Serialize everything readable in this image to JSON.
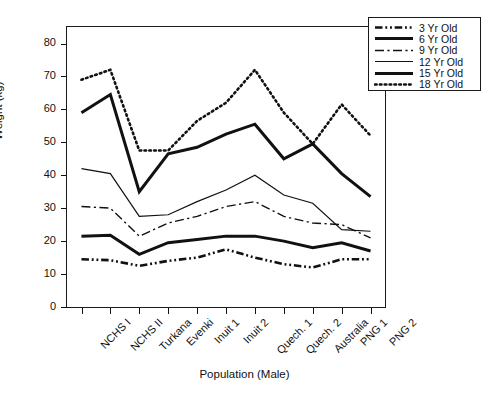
{
  "chart_data": {
    "type": "line",
    "title": "",
    "xlabel": "Population (Male)",
    "ylabel": "Weight (kg)",
    "categories": [
      "NCHS I",
      "NCHS II",
      "Turkana",
      "Evenki",
      "Inuit 1",
      "Inuit 2",
      "Quech. 1",
      "Quech. 2",
      "Australia",
      "PNG 1",
      "PNG 2"
    ],
    "ylim": [
      0,
      85
    ],
    "yticks": [
      0,
      10,
      20,
      30,
      40,
      50,
      60,
      70,
      80
    ],
    "grid": false,
    "legend_position": "top-right",
    "series": [
      {
        "name": "3 Yr Old",
        "style": "dash-dot-dot",
        "width": 2.6,
        "values": [
          14.5,
          14.2,
          12.5,
          14.0,
          15.0,
          17.5,
          15.0,
          13.0,
          12.0,
          14.5,
          14.5
        ]
      },
      {
        "name": "6 Yr Old",
        "style": "solid",
        "width": 2.9,
        "values": [
          21.5,
          21.8,
          16.0,
          19.5,
          20.5,
          21.5,
          21.5,
          20.0,
          18.0,
          19.5,
          17.0
        ]
      },
      {
        "name": "9 Yr Old",
        "style": "dash-dot",
        "width": 1.4,
        "values": [
          30.5,
          30.0,
          21.5,
          25.5,
          27.5,
          30.5,
          32.0,
          27.5,
          25.5,
          25.0,
          21.0
        ]
      },
      {
        "name": "12 Yr Old",
        "style": "solid",
        "width": 1.2,
        "values": [
          42.0,
          40.5,
          27.5,
          28.0,
          32.0,
          35.5,
          40.0,
          34.0,
          31.5,
          23.5,
          23.0
        ]
      },
      {
        "name": "15 Yr Old",
        "style": "solid",
        "width": 3.0,
        "values": [
          59.0,
          64.5,
          35.0,
          46.5,
          48.5,
          52.5,
          55.5,
          45.0,
          49.5,
          40.5,
          33.5
        ]
      },
      {
        "name": "18 Yr Old",
        "style": "dotted",
        "width": 2.6,
        "values": [
          69.0,
          72.0,
          47.5,
          47.5,
          56.5,
          62.0,
          72.0,
          59.0,
          49.5,
          61.5,
          52.0
        ]
      }
    ]
  },
  "legend": {
    "items": [
      {
        "label": "3 Yr Old"
      },
      {
        "label": "6 Yr Old"
      },
      {
        "label": "9 Yr Old"
      },
      {
        "label": "12 Yr Old"
      },
      {
        "label": "15 Yr Old"
      },
      {
        "label": "18 Yr Old"
      }
    ]
  },
  "colors": {
    "ink": "#111111",
    "background": "#ffffff"
  }
}
